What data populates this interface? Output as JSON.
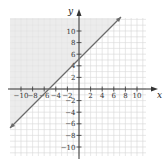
{
  "chart_data": {
    "type": "line",
    "title": "",
    "xlabel": "x",
    "ylabel": "y",
    "xlim": [
      -12,
      12
    ],
    "ylim": [
      -12,
      12
    ],
    "grid": true,
    "x_ticks": [
      -10,
      -8,
      -6,
      -4,
      -2,
      2,
      4,
      6,
      8,
      10
    ],
    "y_ticks": [
      10,
      8,
      6,
      4,
      2,
      -2,
      -4,
      -6,
      -8,
      -10
    ],
    "x_tick_labels": [
      "−10",
      "−8",
      "−6",
      "−4",
      "−2",
      "2",
      "4",
      "6",
      "8",
      "10"
    ],
    "y_tick_labels": [
      "10",
      "8",
      "6",
      "4",
      "2",
      "−2",
      "−4",
      "−6",
      "−8",
      "−10"
    ],
    "series": [
      {
        "name": "boundary line y = x + 5",
        "style": "solid",
        "x": [
          -12,
          7
        ],
        "y": [
          -7,
          12
        ]
      }
    ],
    "shaded_region": "above the line (y ≥ x + 5), upper-left half-plane",
    "colors": {
      "line": "#6b6b6b",
      "shade": "#ececec",
      "grid": "#e2e2e2",
      "axis": "#333333"
    }
  },
  "labels": {
    "x_axis": "x",
    "y_axis": "y"
  }
}
